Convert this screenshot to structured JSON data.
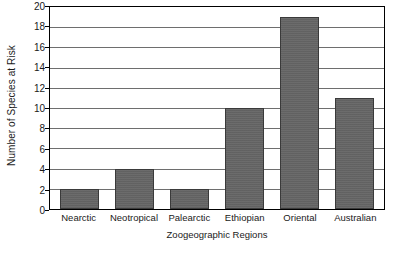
{
  "chart_data": {
    "type": "bar",
    "title": "",
    "subtitle": "",
    "xlabel": "Zoogeographic Regions",
    "ylabel": "Number of Species at Risk",
    "categories": [
      "Nearctic",
      "Neotropical",
      "Palearctic",
      "Ethiopian",
      "Oriental",
      "Australian"
    ],
    "values": [
      2,
      4,
      2,
      10,
      19,
      11
    ],
    "ylim": [
      0,
      20
    ],
    "yticks": [
      0,
      2,
      4,
      6,
      8,
      10,
      12,
      14,
      16,
      18,
      20
    ],
    "ytick_labels": [
      "0",
      "2",
      "4",
      "6",
      "8",
      "10",
      "12",
      "14",
      "16",
      "18",
      "20"
    ],
    "grid": "horizontal",
    "legend": "none",
    "bar_color": "#656565",
    "bar_edge_color": "#3a3a3a",
    "gridline_color": "#6e6e6e",
    "axis_color": "#000000",
    "background_color": "#ffffff",
    "text_color": "#1a1a1a",
    "annotations": []
  }
}
